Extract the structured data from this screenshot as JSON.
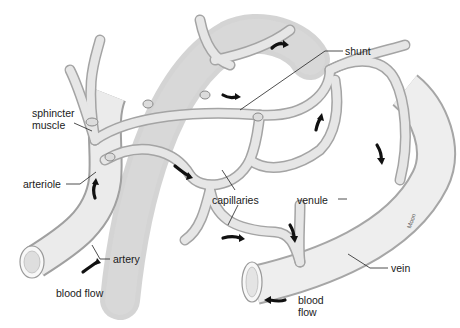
{
  "figure": {
    "labels": {
      "sphincter_line1": "sphincter",
      "sphincter_line2": "muscle",
      "shunt": "shunt",
      "arteriole": "arteriole",
      "capillaries": "capillaries",
      "venule": "venule",
      "vein": "vein",
      "artery": "artery",
      "blood_flow_left": "blood flow",
      "blood_flow_right_line1": "blood",
      "blood_flow_right_line2": "flow",
      "signature": "Moon"
    },
    "colors": {
      "vessel_fill": "#e8e8e8",
      "vessel_shade": "#c4c4c4",
      "vessel_edge": "#9a9a9a",
      "arrow": "#111111",
      "leader_line": "#222222",
      "background": "#ffffff"
    }
  }
}
